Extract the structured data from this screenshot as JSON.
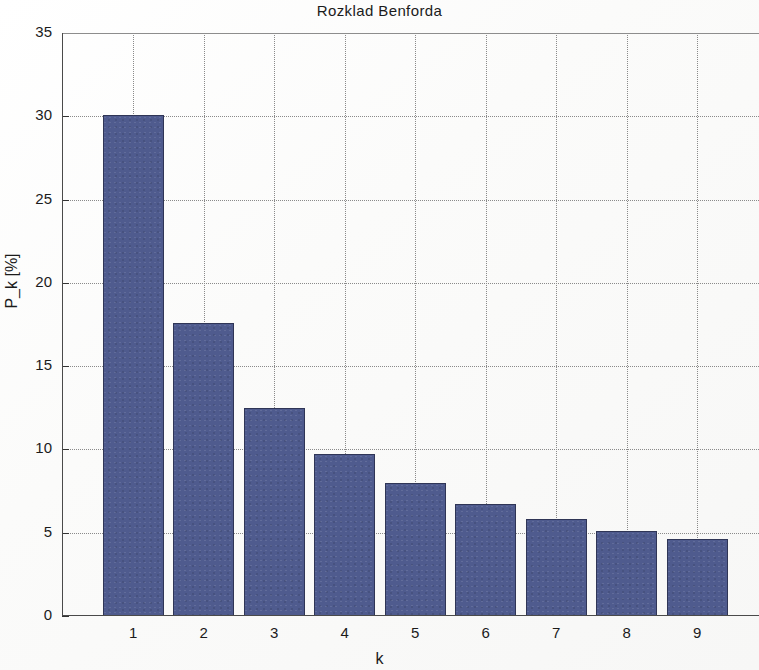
{
  "chart_data": {
    "type": "bar",
    "title": "Rozklad Benforda",
    "xlabel": "k",
    "ylabel": "P_k [%]",
    "categories": [
      "1",
      "2",
      "3",
      "4",
      "5",
      "6",
      "7",
      "8",
      "9"
    ],
    "values": [
      30.1,
      17.6,
      12.5,
      9.7,
      8.0,
      6.7,
      5.8,
      5.1,
      4.6
    ],
    "series": [
      {
        "name": "P_k",
        "values": [
          30.1,
          17.6,
          12.5,
          9.7,
          8.0,
          6.7,
          5.8,
          5.1,
          4.6
        ]
      }
    ],
    "ylim": [
      0,
      35
    ],
    "xlim": [
      0.5,
      9.5
    ],
    "ytick_labels": [
      "0",
      "5",
      "10",
      "15",
      "20",
      "25",
      "30",
      "35"
    ],
    "ytick_values": [
      0,
      5,
      10,
      15,
      20,
      25,
      30,
      35
    ],
    "xtick_labels": [
      "1",
      "2",
      "3",
      "4",
      "5",
      "6",
      "7",
      "8",
      "9"
    ],
    "grid": "dotted-both",
    "legend": null,
    "bar_color": "#4f5b8e",
    "bar_edge_color": "#2f3556",
    "grid_color": "#8a8a8a",
    "axis_color": "#4a4a4a",
    "background_color": "#fdfdfd",
    "text_color": "#1b1b1b"
  }
}
